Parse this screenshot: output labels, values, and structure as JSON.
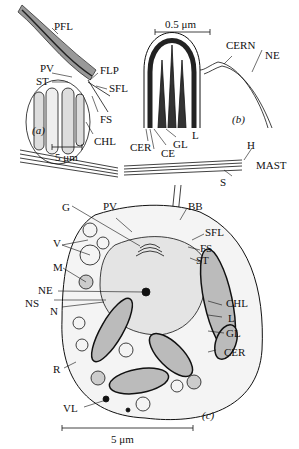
{
  "panel_a": {
    "tag": "(a)",
    "scale": "5 μm",
    "labels": {
      "PFL": "PFL",
      "PV": "PV",
      "ST": "ST",
      "FLP": "FLP",
      "SFL": "SFL",
      "FS": "FS",
      "CHL": "CHL"
    }
  },
  "panel_b": {
    "tag": "(b)",
    "scale": "0.5 μm",
    "labels": {
      "CERN": "CERN",
      "NE": "NE",
      "CER": "CER",
      "CE": "CE",
      "GL": "GL",
      "L": "L"
    }
  },
  "mast": {
    "labels": {
      "H": "H",
      "MAST": "MAST",
      "S": "S"
    }
  },
  "panel_c": {
    "tag": "(c)",
    "scale": "5 μm",
    "labels": {
      "PV": "PV",
      "BB": "BB",
      "G": "G",
      "SFL": "SFL",
      "V": "V",
      "FS": "FS",
      "ST": "ST",
      "M": "M",
      "NE": "NE",
      "NS": "NS",
      "N": "N",
      "CHL": "CHL",
      "L": "L",
      "GL": "GL",
      "CER": "CER",
      "R": "R",
      "VL": "VL"
    }
  }
}
